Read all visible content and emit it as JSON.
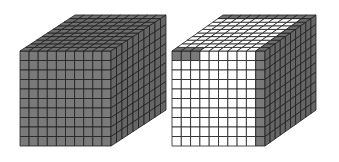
{
  "figure": {
    "colors": {
      "background": "#ffffff",
      "filled": "#7a7a7a",
      "filled_top": "#6e6e6e",
      "filled_side": "#666666",
      "empty": "#ffffff",
      "grid_line": "#1e1e1e"
    },
    "grid": 10,
    "cubes": [
      {
        "id": "solid-cube",
        "front": {
          "x": 20,
          "y": 51,
          "w": 91,
          "h": 95
        },
        "depth": {
          "dx": 55,
          "dy": -36
        },
        "front_filled": "all",
        "top_filled": "all",
        "side_filled": "all"
      },
      {
        "id": "partial-cube",
        "front": {
          "x": 172,
          "y": 51,
          "w": 93,
          "h": 95
        },
        "depth": {
          "dx": 51,
          "dy": -36
        },
        "front_filled": "top-row-first-3-and-last-column",
        "top_filled": "back-row-and-right-column",
        "side_filled": "all"
      }
    ]
  }
}
